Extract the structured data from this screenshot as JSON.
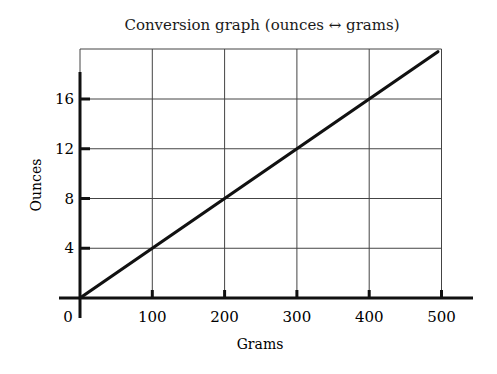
{
  "chart_data": {
    "type": "line",
    "title": "Conversion graph (ounces ↔ grams)",
    "xlabel": "Grams",
    "ylabel": "Ounces",
    "x_ticks": [
      "0",
      "100",
      "200",
      "300",
      "400",
      "500"
    ],
    "y_ticks": [
      "4",
      "8",
      "12",
      "16"
    ],
    "xlim": [
      0,
      500
    ],
    "ylim": [
      0,
      20
    ],
    "grid": true,
    "legend": null,
    "series": [
      {
        "name": "Ounces vs Grams",
        "x": [
          0,
          100,
          200,
          300,
          400,
          495
        ],
        "y": [
          0,
          4,
          8,
          12,
          16,
          19.8
        ]
      }
    ]
  },
  "colors": {
    "line": "#111111",
    "grid": "#444444",
    "axis": "#111111"
  }
}
